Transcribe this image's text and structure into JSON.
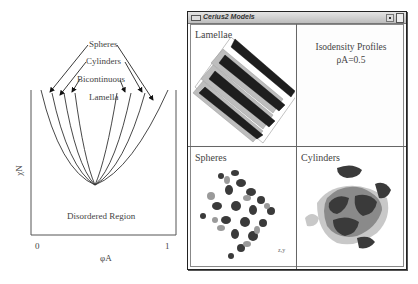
{
  "phase_diagram": {
    "y_axis_label": "χN",
    "x_axis_label": "φA",
    "x_ticks": [
      "0",
      "1"
    ],
    "region_label": "Disordered Region",
    "phase_labels": [
      "Spheres",
      "Cylinders",
      "Bicontinuous",
      "Lamella"
    ]
  },
  "window": {
    "title": "Cerius2 Models",
    "icons": {
      "menu": "window-menu-icon",
      "minimize": "minimize-icon",
      "maximize": "maximize-icon"
    },
    "panes": {
      "top_left": {
        "label": "Lamellae"
      },
      "top_right": {
        "title_line1": "Isodensity Profiles",
        "title_line2": "ρA=0.5"
      },
      "bottom_left": {
        "label": "Spheres",
        "corner_mark": "z,y"
      },
      "bottom_right": {
        "label": "Cylinders"
      }
    }
  },
  "colors": {
    "line": "#333333",
    "dark_sheet": "#1e1e1e",
    "light_sheet": "#bdbdbd",
    "blob_dark": "#3a3a3a",
    "blob_mid": "#8a8a8a",
    "blob_light": "#c8c8c8"
  }
}
